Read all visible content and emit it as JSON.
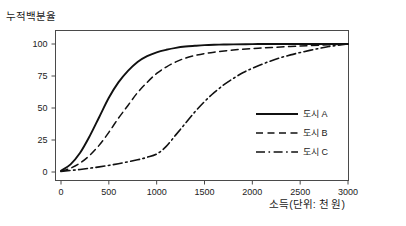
{
  "chart_data": {
    "type": "line",
    "title": "",
    "ylabel": "누적백분율",
    "xlabel": "소득(단위: 천 원)",
    "xlim": [
      0,
      3100
    ],
    "ylim": [
      -4,
      108
    ],
    "xticks": [
      0,
      500,
      1000,
      1500,
      2000,
      2500,
      3000
    ],
    "xtick_labels": [
      "0",
      "500",
      "1000",
      "1500",
      "2000",
      "2500",
      "3000"
    ],
    "yticks": [
      0,
      25,
      50,
      75,
      100
    ],
    "ytick_labels": [
      "0",
      "25",
      "50",
      "75",
      "100"
    ],
    "grid": false,
    "legend_position": "center-right-inside",
    "series": [
      {
        "name": "도시 A",
        "style": "solid",
        "x": [
          0,
          100,
          200,
          300,
          400,
          500,
          600,
          700,
          800,
          900,
          1000,
          1100,
          1200,
          1300,
          1400,
          1500,
          1600,
          1700,
          1800,
          2000,
          2200,
          2500,
          3000
        ],
        "y": [
          1,
          6,
          15,
          28,
          43,
          58,
          70,
          79,
          86,
          90.5,
          93.5,
          95.5,
          97,
          98,
          98.6,
          99.1,
          99.4,
          99.6,
          99.7,
          99.9,
          100,
          100,
          100
        ]
      },
      {
        "name": "도시 B",
        "style": "dashed",
        "x": [
          0,
          100,
          200,
          300,
          400,
          500,
          600,
          700,
          800,
          900,
          1000,
          1100,
          1200,
          1300,
          1400,
          1500,
          1600,
          1800,
          2000,
          2200,
          2500,
          2800,
          3000
        ],
        "y": [
          0.5,
          3,
          7,
          13,
          21,
          31,
          42,
          52,
          62,
          70,
          77,
          82,
          86,
          89,
          91,
          92.5,
          93.6,
          95.3,
          96.4,
          97.3,
          98.4,
          99.4,
          100
        ]
      },
      {
        "name": "도시 C",
        "style": "dash-dot",
        "x": [
          0,
          200,
          400,
          600,
          800,
          900,
          1000,
          1100,
          1200,
          1300,
          1400,
          1500,
          1600,
          1700,
          1800,
          1900,
          2000,
          2200,
          2400,
          2600,
          2800,
          3000
        ],
        "y": [
          0.5,
          2,
          4,
          6.5,
          9.5,
          11.5,
          14,
          20,
          29,
          38,
          47,
          55,
          62,
          68,
          73,
          77.5,
          81,
          87,
          91.5,
          95,
          98,
          100
        ]
      }
    ]
  },
  "legend": {
    "items": [
      {
        "label": "도시 A"
      },
      {
        "label": "도시 B"
      },
      {
        "label": "도시 C"
      }
    ]
  }
}
